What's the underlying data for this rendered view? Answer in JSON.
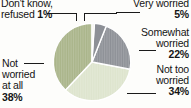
{
  "chart_data": {
    "type": "pie",
    "title": "",
    "categories": [
      "Don't know, refused",
      "Very worried",
      "Somewhat worried",
      "Not too worried",
      "Not worried at all"
    ],
    "values": [
      1,
      5,
      22,
      34,
      38
    ],
    "value_labels": [
      "1%",
      "5%",
      "22%",
      "34%",
      "38%"
    ],
    "colors": [
      "#f4f4ee",
      "#8d9096",
      "#8d9096",
      "#dde4cd",
      "#a9b489"
    ],
    "start_angle_deg": 0,
    "direction": "clockwise",
    "legend": "none",
    "grid": false,
    "background": "#fdfdfb"
  },
  "labels": {
    "dont_know": {
      "line1": "Don't know,",
      "line2": "refused",
      "percent": "1%"
    },
    "very_worried": {
      "line1": "Very worried",
      "percent": "5%"
    },
    "somewhat_worried": {
      "line1": "Somewhat",
      "line2": "worried",
      "percent": "22%"
    },
    "not_too_worried": {
      "line1": "Not too",
      "line2": "worried",
      "percent": "34%"
    },
    "not_worried_at_all": {
      "line1": "Not",
      "line2": "worried",
      "line3": "at all",
      "percent": "38%"
    }
  }
}
